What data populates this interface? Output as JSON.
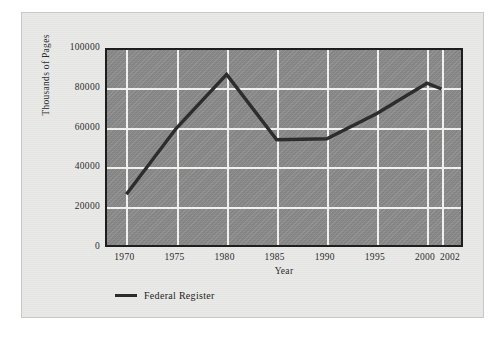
{
  "chart_data": {
    "type": "line",
    "title": "",
    "xlabel": "Year",
    "ylabel": "Thousands of Pages",
    "categories": [
      "1970",
      "1975",
      "1980",
      "1985",
      "1990",
      "1995",
      "2000",
      "2002"
    ],
    "x": [
      1970,
      1975,
      1980,
      1985,
      1990,
      1995,
      2000,
      2002
    ],
    "xlim": [
      1970,
      2002
    ],
    "ylim": [
      0,
      100000
    ],
    "yticks": [
      0,
      20000,
      40000,
      60000,
      80000,
      100000
    ],
    "ytick_labels": [
      "0",
      "20000",
      "40000",
      "60000",
      "80000",
      "100000"
    ],
    "grid": true,
    "legend_position": "below-left",
    "series": [
      {
        "name": "Federal Register",
        "color": "#2b2b2b",
        "values": [
          26000,
          60000,
          87500,
          54000,
          54500,
          67500,
          83000,
          80000
        ]
      }
    ]
  },
  "axes": {
    "y_title": "Thousands of Pages",
    "x_title": "Year",
    "y_tick_labels": [
      "100000",
      "80000",
      "60000",
      "40000",
      "20000",
      "0"
    ],
    "x_tick_labels": [
      "1970",
      "1975",
      "1980",
      "1985",
      "1990",
      "1995",
      "2000",
      "2002"
    ]
  },
  "legend": {
    "entries": [
      {
        "label": "Federal Register",
        "swatch": "line-swatch",
        "color": "#2b2b2b"
      }
    ]
  },
  "style": {
    "page_background": "#e9e9e7",
    "plot_background": "#8c8c8c",
    "gridline_color": "#f2f2f0",
    "axis_border_color": "#1c1c1c",
    "series_color": "#2b2b2b"
  }
}
